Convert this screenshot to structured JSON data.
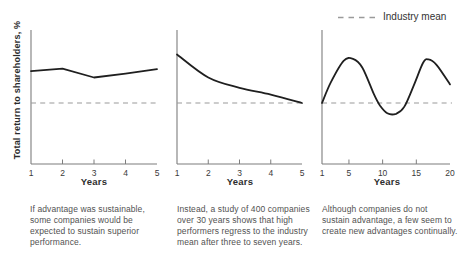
{
  "figure": {
    "y_axis_label": "Total return to shareholders, %",
    "legend": {
      "label": "Industry mean",
      "line_style": "dashed"
    },
    "colors": {
      "series_line": "#1f1f1f",
      "mean_line": "#9a9a9a",
      "axis": "#7d7d7d",
      "tick_text": "#3a3a3a",
      "caption_text": "#525252"
    }
  },
  "chart_data": [
    {
      "type": "line",
      "xlabel": "Years",
      "x_range": [
        1,
        5
      ],
      "x_tick_labels": [
        "1",
        "2",
        "3",
        "4",
        "5"
      ],
      "curve": "linear",
      "industry_mean_value": 0,
      "y_units": "relative_to_industry_mean",
      "ylim": [
        -1.24,
        1.49
      ],
      "series": [
        {
          "name": "total-return-to-shareholders",
          "x": [
            1,
            2,
            3,
            4,
            5
          ],
          "values": [
            0.65,
            0.7,
            0.52,
            0.6,
            0.69
          ]
        }
      ],
      "caption": "If advantage was sustainable,\nsome companies would be\nexpected to sustain superior\nperformance."
    },
    {
      "type": "line",
      "xlabel": "Years",
      "x_range": [
        1,
        5
      ],
      "x_tick_labels": [
        "1",
        "2",
        "3",
        "4",
        "5"
      ],
      "curve": "smooth",
      "industry_mean_value": 0,
      "y_units": "relative_to_industry_mean",
      "ylim": [
        -1.24,
        1.49
      ],
      "series": [
        {
          "name": "total-return-to-shareholders",
          "x": [
            1,
            2,
            3,
            4,
            5
          ],
          "values": [
            0.99,
            0.52,
            0.31,
            0.17,
            0.0
          ]
        }
      ],
      "caption": "Instead, a study of 400 companies\nover 30 years shows that high\nperformers regress to the industry\nmean after three to seven years."
    },
    {
      "type": "line",
      "xlabel": "Years",
      "x_range": [
        1,
        20
      ],
      "x_tick_labels": [
        "1",
        "5",
        "10",
        "15",
        "20"
      ],
      "x_tick_positions": [
        1,
        5,
        10,
        15,
        20
      ],
      "curve": "smooth",
      "industry_mean_value": 0,
      "y_units": "relative_to_industry_mean",
      "ylim": [
        -1.24,
        1.49
      ],
      "series": [
        {
          "name": "total-return-to-shareholders",
          "x": [
            1,
            2.3,
            4.2,
            5.6,
            7,
            8.7,
            9.6,
            10.7,
            12,
            13.2,
            14.6,
            16,
            16.8,
            18,
            20
          ],
          "values": [
            0,
            0.42,
            0.86,
            0.9,
            0.72,
            0.18,
            -0.05,
            -0.21,
            -0.22,
            -0.08,
            0.35,
            0.82,
            0.89,
            0.78,
            0.38
          ]
        }
      ],
      "caption": "Although companies do not\nsustain advantage, a few seem to\ncreate new advantages continually."
    }
  ]
}
